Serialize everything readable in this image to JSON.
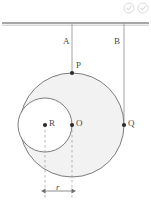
{
  "figure": {
    "type": "geometry-diagram",
    "background": "#ffffff",
    "stroke_color": "#6e6e6e",
    "fill_color": "#f2f2f2",
    "label_color": "#4a4a4a",
    "ceiling": {
      "label": "",
      "y": 23,
      "x_start": 2,
      "x_end": 149
    },
    "strings": [
      {
        "name": "A",
        "label": "A",
        "x": 72,
        "y_top": 23,
        "y_bottom": 73,
        "label_x": 63,
        "label_y": 38
      },
      {
        "name": "B",
        "label": "B",
        "x": 124,
        "y_top": 23,
        "y_bottom": 125,
        "label_x": 114,
        "label_y": 38
      }
    ],
    "circles": [
      {
        "name": "outer-circle",
        "center_label": "O",
        "cx": 72,
        "cy": 125,
        "r": 52
      },
      {
        "name": "inner-circle",
        "center_label": "R",
        "cx": 45,
        "cy": 125,
        "r": 27
      }
    ],
    "points": [
      {
        "name": "P",
        "label": "P",
        "x": 72,
        "y": 73,
        "label_x": 76,
        "label_y": 62
      },
      {
        "name": "O",
        "label": "O",
        "x": 72,
        "y": 125,
        "label_x": 76,
        "label_y": 120
      },
      {
        "name": "R",
        "label": "R",
        "x": 45,
        "y": 125,
        "label_x": 49,
        "label_y": 120
      },
      {
        "name": "Q",
        "label": "Q",
        "x": 124,
        "y": 125,
        "label_x": 128,
        "label_y": 120
      }
    ],
    "dimension": {
      "label": "r",
      "x_start": 45,
      "x_end": 72,
      "y": 191,
      "label_x": 56,
      "label_y": 184,
      "guide_top": 125,
      "guide_bottom": 200
    }
  },
  "overlay": {
    "icons": [
      {
        "name": "check-circle-icon",
        "glyph": "check"
      },
      {
        "name": "check-circle-icon-secondary",
        "glyph": "check"
      }
    ]
  }
}
